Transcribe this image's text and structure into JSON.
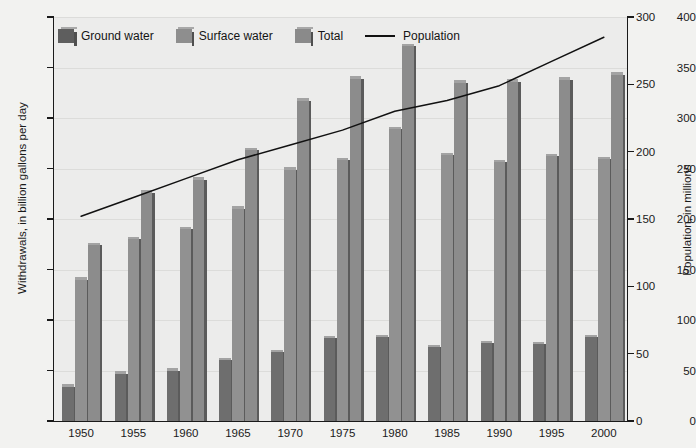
{
  "chart_data": {
    "type": "bar",
    "title": "",
    "xlabel": "",
    "ylabel": "Withdrawals, in billion gallons per day",
    "ylabel_right": "Population, in millions",
    "ylim": [
      0,
      400
    ],
    "ylim_right": [
      0,
      300
    ],
    "yticks": [
      0,
      50,
      100,
      150,
      200,
      250,
      300,
      350,
      400
    ],
    "yticks_right": [
      0,
      50,
      100,
      150,
      200,
      250,
      300
    ],
    "grid": true,
    "legend_position": "top-left",
    "categories": [
      "1950",
      "1955",
      "1960",
      "1965",
      "1970",
      "1975",
      "1980",
      "1985",
      "1990",
      "1995",
      "2000"
    ],
    "series": [
      {
        "name": "Ground water",
        "type": "bar",
        "axis": "left",
        "color": "#6e6e6e",
        "values": [
          34,
          47,
          50,
          60,
          68,
          82,
          83,
          73,
          77,
          76,
          83
        ]
      },
      {
        "name": "Surface water",
        "type": "bar",
        "axis": "left",
        "color": "#919191",
        "values": [
          140,
          180,
          190,
          210,
          249,
          258,
          289,
          263,
          256,
          262,
          259
        ]
      },
      {
        "name": "Total",
        "type": "bar",
        "axis": "left",
        "color": "#8c8c8c",
        "values": [
          174,
          226,
          239,
          268,
          317,
          339,
          371,
          335,
          336,
          338,
          343
        ]
      },
      {
        "name": "Population",
        "type": "line",
        "axis": "right",
        "color": "#111111",
        "values": [
          152,
          166,
          180,
          194,
          205,
          216,
          230,
          238,
          249,
          267,
          285
        ]
      }
    ]
  },
  "legend": {
    "items": [
      {
        "label": "Ground water",
        "icon": "legend-swatch-ground-water"
      },
      {
        "label": "Surface water",
        "icon": "legend-swatch-surface-water"
      },
      {
        "label": "Total",
        "icon": "legend-swatch-total"
      },
      {
        "label": "Population",
        "icon": "legend-line-population"
      }
    ]
  },
  "axes": {
    "left": {
      "title": "Withdrawals, in billion gallons per day",
      "ticks": [
        "400",
        "350",
        "300",
        "250",
        "200",
        "150",
        "100",
        "50",
        "0"
      ]
    },
    "right": {
      "title": "Population, in millions",
      "ticks": [
        "300",
        "250",
        "200",
        "150",
        "100",
        "50",
        "0"
      ]
    },
    "bottom": {
      "ticks": [
        "1950",
        "1955",
        "1960",
        "1965",
        "1970",
        "1975",
        "1980",
        "1985",
        "1990",
        "1995",
        "2000"
      ]
    }
  }
}
